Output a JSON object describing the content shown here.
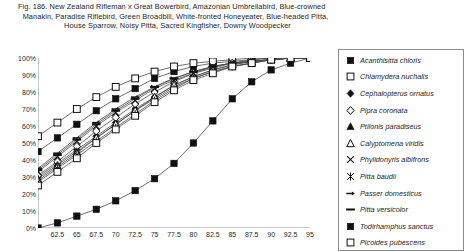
{
  "caption": {
    "line1": "Fig. 186.  New Zealand Rifleman x Great Bowerbird, Amazonian Umbrellabird, Blue-crowned",
    "line2": "Manakin, Paradise Riflebird, Green Broadbill, White-fronted Honeyeater, Blue-headed Pitta,",
    "line3": "House Sparrow, Noisy Pitta, Sacred Kingfisher, Downy Woodpecker"
  },
  "chart_data": {
    "type": "line",
    "xlabel": "",
    "ylabel": "",
    "xlim": [
      60,
      95
    ],
    "ylim": [
      0,
      100
    ],
    "grid": false,
    "legend_position": "right",
    "x": [
      60,
      62.5,
      65,
      67.5,
      70,
      72.5,
      75,
      77.5,
      80,
      82.5,
      85,
      87.5,
      90,
      92.5,
      95
    ],
    "x_tick_labels": [
      "",
      "62.5",
      "65",
      "67.5",
      "70",
      "72.5",
      "75",
      "77.5",
      "80",
      "82.5",
      "85",
      "87.5",
      "90",
      "92.5",
      "95"
    ],
    "y_tick_labels": [
      "0%",
      "10%",
      "20%",
      "30%",
      "40%",
      "50%",
      "60%",
      "70%",
      "80%",
      "90%",
      "100%"
    ],
    "series": [
      {
        "name": "Acanthisitta chloris",
        "marker": "filled-square",
        "values": [
          45,
          53,
          61,
          69,
          76,
          82,
          88,
          92,
          95,
          97,
          98,
          99,
          100,
          100,
          100
        ]
      },
      {
        "name": "Chlamydera nuchalis",
        "marker": "open-square",
        "values": [
          54,
          62,
          70,
          77,
          83,
          88,
          92,
          95,
          97,
          98,
          99,
          100,
          100,
          100,
          100
        ]
      },
      {
        "name": "Cephalopterus ornatus",
        "marker": "filled-diamond",
        "values": [
          30,
          38,
          46,
          54,
          62,
          70,
          77,
          84,
          89,
          93,
          96,
          98,
          99,
          100,
          100
        ]
      },
      {
        "name": "Pipra coronata",
        "marker": "open-diamond",
        "values": [
          31,
          39,
          48,
          57,
          65,
          73,
          80,
          86,
          91,
          94,
          97,
          98,
          99,
          100,
          100
        ]
      },
      {
        "name": "Ptilonis paradiseus",
        "marker": "filled-triangle",
        "values": [
          29,
          37,
          45,
          53,
          61,
          69,
          76,
          83,
          88,
          92,
          95,
          97,
          99,
          100,
          100
        ]
      },
      {
        "name": "Calyptomena viridis",
        "marker": "open-triangle",
        "values": [
          28,
          36,
          44,
          53,
          61,
          69,
          77,
          84,
          89,
          93,
          96,
          98,
          99,
          100,
          100
        ]
      },
      {
        "name": "Phylidonyris albifrons",
        "marker": "cross-x",
        "values": [
          33,
          42,
          51,
          60,
          68,
          75,
          82,
          87,
          91,
          95,
          97,
          98,
          99,
          100,
          100
        ]
      },
      {
        "name": "Pitta baudii",
        "marker": "star",
        "values": [
          27,
          35,
          43,
          51,
          59,
          67,
          75,
          82,
          88,
          92,
          95,
          97,
          99,
          100,
          100
        ]
      },
      {
        "name": "Passer domesticus",
        "marker": "dash-arrow",
        "values": [
          35,
          44,
          53,
          62,
          70,
          77,
          83,
          88,
          92,
          95,
          97,
          99,
          100,
          100,
          100
        ]
      },
      {
        "name": "Pitta versicolor",
        "marker": "dash",
        "values": [
          34,
          43,
          52,
          61,
          69,
          76,
          83,
          88,
          92,
          95,
          97,
          98,
          99,
          100,
          100
        ]
      },
      {
        "name": "Todirhamphus sanctus",
        "marker": "filled-square",
        "values": [
          0,
          3,
          7,
          11,
          16,
          22,
          29,
          38,
          50,
          63,
          76,
          86,
          93,
          97,
          100
        ]
      },
      {
        "name": "Picoides pubescens",
        "marker": "open-square",
        "values": [
          25,
          33,
          41,
          50,
          58,
          66,
          74,
          81,
          87,
          91,
          95,
          97,
          99,
          100,
          100
        ]
      }
    ]
  }
}
